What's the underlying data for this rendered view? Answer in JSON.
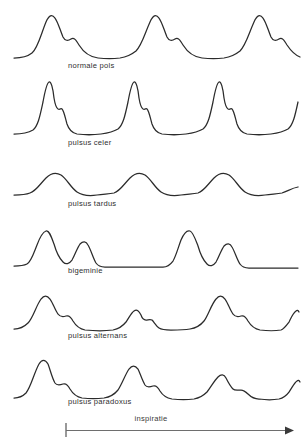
{
  "figure": {
    "background_color": "#ffffff",
    "trace_color": "#2b2b2b",
    "axis_color": "#6e6e6e",
    "label_color": "#2f2f2f"
  },
  "traces": [
    {
      "label": "normale pols",
      "description": "Four evenly spaced, moderately tall rounded pulse waves with a small dicrotic notch on the descending limb and a flat diastolic baseline between beats.",
      "beat_count": 4,
      "relative_amplitudes": [
        1.0,
        1.0,
        1.0,
        1.0
      ],
      "path": "M 14 50 C 22 50 27 49 32 45 C 38 40 41 26 46 14 C 49 7 52 6 55 10 C 58 14 60 22 63 29 C 65 33 68 33 71 31 C 74 29 76 32 79 37 C 84 45 90 49 98 50 C 106 51 113 51 120 50 C 126 49 131 47 136 43 C 142 37 145 25 150 14 C 153 7 156 6 159 10 C 162 14 164 22 167 29 C 169 33 172 33 175 31 C 178 29 180 32 183 37 C 188 45 194 49 202 50 C 210 51 217 51 224 50 C 230 49 235 47 240 43 C 246 37 249 25 254 14 C 257 7 260 6 263 10 C 266 14 268 22 271 29 C 273 33 276 33 279 31 C 282 29 284 32 287 37 C 291 43 295 47 300 49"
    },
    {
      "label": "pulsus celer",
      "description": "Tall, narrow, sharply peaked waves with a very steep upstroke and a shoulder partway down the descending limb; long flat baseline between beats.",
      "beat_count": 4,
      "relative_amplitudes": [
        1.0,
        1.0,
        1.0,
        1.0
      ],
      "path": "M 14 58 C 22 58 28 57 33 54 C 38 50 40 40 43 26 C 45 15 47 7 49 6 C 51 5 53 12 54 22 C 55 28 56 32 58 33 C 60 34 61 32 62 33 C 64 35 65 41 67 48 C 69 54 72 57 77 58 C 85 59 93 59 101 58 C 108 57 113 56 118 53 C 123 49 125 40 128 26 C 130 15 132 7 134 6 C 136 5 138 12 139 22 C 140 28 141 32 143 33 C 145 34 146 32 147 33 C 149 35 150 41 152 48 C 154 54 157 57 162 58 C 170 59 178 59 186 58 C 193 57 198 56 203 53 C 208 49 210 40 213 26 C 215 15 217 7 219 6 C 221 5 223 12 224 22 C 225 28 226 32 228 33 C 230 34 231 32 232 33 C 234 35 235 41 237 48 C 239 54 242 57 247 58 C 255 59 263 59 271 58 C 278 57 283 56 288 53 C 293 49 295 40 298 26"
    },
    {
      "label": "pulsus tardus",
      "description": "Low-amplitude, broad, slowly rising and slowly falling rounded humps; the peaks are blunted and there is no sharp upstroke.",
      "beat_count": 4,
      "relative_amplitudes": [
        0.55,
        0.55,
        0.55,
        0.55
      ],
      "path": "M 14 37 C 20 37 25 37 30 35 C 36 33 40 26 46 20 C 51 15 56 14 61 17 C 67 21 71 30 77 34 C 83 38 90 38 97 37 C 104 36 109 36 114 35 C 120 33 124 26 130 20 C 135 15 140 14 145 17 C 151 21 155 30 161 34 C 167 38 174 38 181 37 C 188 36 193 36 198 35 C 204 33 208 26 214 20 C 219 15 224 14 229 17 C 235 21 239 30 245 34 C 251 38 258 38 265 37 C 272 36 277 36 282 35 C 288 33 292 30 298 29"
    },
    {
      "label": "bigeminie",
      "description": "Beats occur in coupled pairs: a tall normal beat immediately followed by a smaller premature beat, then a long compensatory pause with a flat baseline before the next pair.",
      "beat_count": 4,
      "relative_amplitudes": [
        1.0,
        0.62,
        1.0,
        0.62
      ],
      "path": "M 14 46 C 19 46 23 46 27 44 C 31 42 33 35 37 25 C 40 17 43 12 46 11 C 49 10 51 16 54 24 C 56 31 59 38 63 42 C 66 45 69 44 72 40 C 75 35 77 28 80 24 C 83 21 86 21 88 25 C 91 30 93 38 96 43 C 98 46 101 47 105 47 C 115 47 125 47 135 47 C 145 47 155 47 163 47 C 167 47 170 45 173 41 C 176 36 178 28 181 20 C 184 13 187 10 190 11 C 193 12 195 18 198 26 C 200 33 203 40 207 44 C 210 47 213 46 216 42 C 219 37 221 30 224 26 C 227 23 230 23 232 27 C 235 32 237 40 240 44 C 242 47 245 48 249 48 C 259 48 269 48 279 48 C 287 48 293 48 298 48"
    },
    {
      "label": "pulsus alternans",
      "description": "Regular rhythm in which beat amplitude alternates between a large, broad wave and a much smaller narrow wave; the timing between all beats stays equal.",
      "beat_count": 4,
      "relative_amplitudes": [
        1.0,
        0.42,
        1.0,
        0.42
      ],
      "path": "M 14 43 C 20 43 24 41 28 37 C 33 32 36 20 41 13 C 44 9 47 9 50 13 C 53 17 55 24 58 28 C 60 31 63 31 66 30 C 69 29 71 31 73 35 C 76 40 80 43 85 44 C 95 45 105 45 113 44 C 118 43 122 41 126 36 C 129 32 131 27 134 25 C 137 23 139 25 141 29 C 142 32 144 34 146 34 C 148 34 150 33 152 34 C 154 36 156 40 159 42 C 162 44 166 44 171 44 C 178 44 184 44 190 43 C 196 42 200 40 204 35 C 208 30 211 19 216 13 C 219 9 222 9 225 13 C 228 17 230 24 233 28 C 235 31 238 31 241 30 C 244 29 246 31 248 35 C 251 40 255 43 260 44 C 268 45 275 45 281 44 C 284 43 286 40 289 36 C 291 32 293 27 296 25 C 297 24 298 24 299 26"
    },
    {
      "label": "pulsus paradoxus",
      "description": "Successive pulse waves become progressively smaller as inspiration proceeds: a tall first beat, then steadily diminishing beats with the fourth markedly attenuated.",
      "beat_count": 4,
      "relative_amplitudes": [
        1.0,
        0.78,
        0.52,
        0.34
      ],
      "path": "M 14 46 C 19 46 22 45 26 41 C 31 35 34 21 39 12 C 42 7 45 7 48 12 C 50 17 52 26 55 31 C 57 34 60 33 63 32 C 66 31 68 33 70 37 C 73 42 77 45 82 46 C 90 47 97 47 104 46 C 110 45 114 43 118 38 C 122 32 125 23 129 17 C 132 13 135 13 138 17 C 140 21 142 28 145 33 C 147 36 150 35 153 34 C 156 33 158 35 160 39 C 163 44 167 46 172 47 C 180 48 187 48 194 47 C 199 46 203 44 207 40 C 211 35 214 29 218 25 C 221 22 224 22 226 26 C 228 30 230 34 233 37 C 235 39 238 38 241 38 C 244 38 246 40 248 42 C 251 45 254 47 259 47 C 266 48 273 48 279 47 C 283 46 286 44 289 40 C 292 36 294 31 297 29 C 298 28 299 28 300 30"
    }
  ],
  "axis": {
    "label": "inspiratie",
    "direction": "left-to-right",
    "has_start_tick": true,
    "has_end_arrow": true
  }
}
